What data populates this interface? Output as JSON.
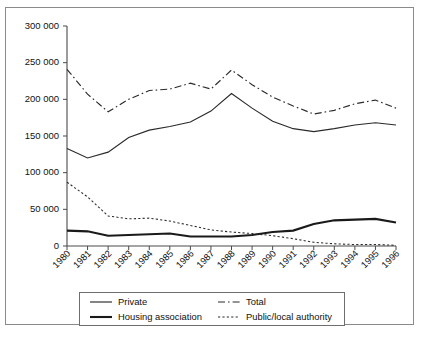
{
  "chart_data": {
    "type": "line",
    "title": "",
    "xlabel": "",
    "ylabel": "",
    "grid": false,
    "legend_position": "bottom",
    "ylim": [
      0,
      300000
    ],
    "ytick_step": 50000,
    "ytick_labels": [
      "300 000",
      "250 000",
      "200 000",
      "150 000",
      "100 000",
      "50 000",
      "0"
    ],
    "ytick_values": [
      300000,
      250000,
      200000,
      150000,
      100000,
      50000,
      0
    ],
    "categories": [
      "1980",
      "1981",
      "1982",
      "1983",
      "1984",
      "1985",
      "1986",
      "1987",
      "1988",
      "1989",
      "1990",
      "1991",
      "1992",
      "1993",
      "1994",
      "1995",
      "1996"
    ],
    "series": [
      {
        "name": "Private",
        "style": "solid-thin",
        "values": [
          133000,
          120000,
          128000,
          148000,
          158000,
          163000,
          169000,
          184000,
          208000,
          188000,
          170000,
          160000,
          156000,
          160000,
          165000,
          168000,
          165000
        ]
      },
      {
        "name": "Total",
        "style": "dash-dot",
        "values": [
          241000,
          207000,
          183000,
          200000,
          212000,
          214000,
          222000,
          214000,
          240000,
          220000,
          203000,
          191000,
          180000,
          185000,
          194000,
          199000,
          188000
        ]
      },
      {
        "name": "Housing association",
        "style": "solid-thick",
        "values": [
          21000,
          20000,
          14000,
          15000,
          16000,
          17000,
          13000,
          13000,
          13000,
          15000,
          19000,
          21000,
          30000,
          35000,
          36000,
          37000,
          32000
        ]
      },
      {
        "name": "Public/local authority",
        "style": "dotted",
        "values": [
          87000,
          67000,
          41000,
          37000,
          38000,
          34000,
          28000,
          22000,
          19000,
          17000,
          14000,
          10000,
          5000,
          3000,
          2000,
          2000,
          1000
        ]
      }
    ]
  },
  "legend": {
    "items": [
      {
        "label": "Private",
        "style": "solid-thin"
      },
      {
        "label": "Total",
        "style": "dash-dot"
      },
      {
        "label": "Housing association",
        "style": "solid-thick"
      },
      {
        "label": "Public/local authority",
        "style": "dotted"
      }
    ]
  }
}
